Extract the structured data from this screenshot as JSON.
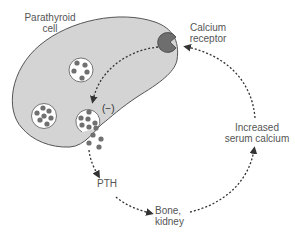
{
  "diagram": {
    "labels": {
      "cell": [
        "Parathyroid",
        "cell"
      ],
      "receptor": [
        "Calcium",
        "receptor"
      ],
      "inhibition": "(−)",
      "pth": "PTH",
      "target": [
        "Bone,",
        "kidney"
      ],
      "serum": [
        "Increased",
        "serum calcium"
      ]
    },
    "colors": {
      "cell_fill": "#d4d4d4",
      "cell_stroke": "#555555",
      "granule": "#707070",
      "receptor": "#6e6e6e",
      "arrow": "#333333",
      "text": "#555555"
    },
    "flow": [
      "Increased serum calcium",
      "Calcium receptor",
      "(−) secretion",
      "PTH",
      "Bone, kidney",
      "Increased serum calcium"
    ]
  }
}
